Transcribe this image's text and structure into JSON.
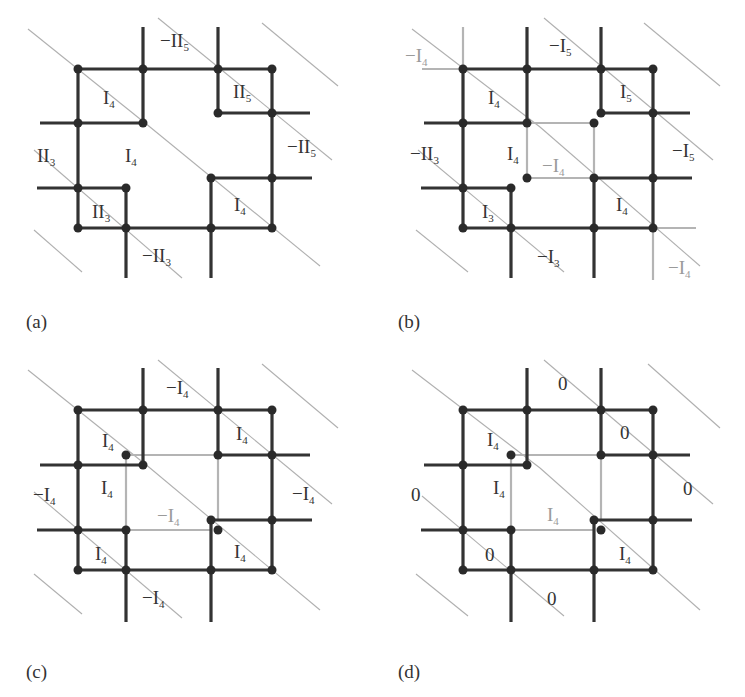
{
  "figure": {
    "panels": [
      {
        "id": "a",
        "caption": "(a)",
        "labels": [
          {
            "text": "−II",
            "sub": "5",
            "x": 160,
            "y": 47,
            "light": false
          },
          {
            "text": "I",
            "sub": "4",
            "x": 103,
            "y": 104,
            "light": false
          },
          {
            "text": "II",
            "sub": "5",
            "x": 233,
            "y": 98,
            "light": false
          },
          {
            "text": "II",
            "sub": "3",
            "x": 37,
            "y": 162,
            "light": false
          },
          {
            "text": "I",
            "sub": "4",
            "x": 125,
            "y": 162,
            "light": false
          },
          {
            "text": "−II",
            "sub": "5",
            "x": 287,
            "y": 153,
            "light": false
          },
          {
            "text": "II",
            "sub": "3",
            "x": 92,
            "y": 218,
            "light": false
          },
          {
            "text": "I",
            "sub": "4",
            "x": 234,
            "y": 211,
            "light": false
          },
          {
            "text": "−II",
            "sub": "3",
            "x": 142,
            "y": 262,
            "light": false
          }
        ]
      },
      {
        "id": "b",
        "caption": "(b)",
        "labels": [
          {
            "text": "−I",
            "sub": "4",
            "x": 405,
            "y": 62,
            "light": true
          },
          {
            "text": "−I",
            "sub": "5",
            "x": 549,
            "y": 52,
            "light": false
          },
          {
            "text": "I",
            "sub": "4",
            "x": 488,
            "y": 104,
            "light": false
          },
          {
            "text": "I",
            "sub": "5",
            "x": 620,
            "y": 98,
            "light": false
          },
          {
            "text": "−II",
            "sub": "3",
            "x": 410,
            "y": 160,
            "light": false
          },
          {
            "text": "I",
            "sub": "4",
            "x": 507,
            "y": 160,
            "light": false
          },
          {
            "text": "−I",
            "sub": "4",
            "x": 542,
            "y": 172,
            "light": true
          },
          {
            "text": "−I",
            "sub": "5",
            "x": 672,
            "y": 157,
            "light": false
          },
          {
            "text": "I",
            "sub": "3",
            "x": 482,
            "y": 218,
            "light": false
          },
          {
            "text": "I",
            "sub": "4",
            "x": 616,
            "y": 211,
            "light": false
          },
          {
            "text": "−I",
            "sub": "3",
            "x": 537,
            "y": 263,
            "light": false
          },
          {
            "text": "−I",
            "sub": "4",
            "x": 668,
            "y": 274,
            "light": true
          }
        ]
      },
      {
        "id": "c",
        "caption": "(c)",
        "labels": [
          {
            "text": "−I",
            "sub": "4",
            "x": 166,
            "y": 394,
            "light": false
          },
          {
            "text": "I",
            "sub": "4",
            "x": 102,
            "y": 447,
            "light": false
          },
          {
            "text": "I",
            "sub": "4",
            "x": 236,
            "y": 440,
            "light": false
          },
          {
            "text": "I",
            "sub": "4",
            "x": 101,
            "y": 494,
            "light": false
          },
          {
            "text": "−I",
            "sub": "4",
            "x": 33,
            "y": 501,
            "light": false
          },
          {
            "text": "−I",
            "sub": "4",
            "x": 292,
            "y": 500,
            "light": false
          },
          {
            "text": "−I",
            "sub": "4",
            "x": 157,
            "y": 522,
            "light": true
          },
          {
            "text": "I",
            "sub": "4",
            "x": 95,
            "y": 560,
            "light": false
          },
          {
            "text": "I",
            "sub": "4",
            "x": 234,
            "y": 558,
            "light": false
          },
          {
            "text": "−I",
            "sub": "4",
            "x": 142,
            "y": 604,
            "light": false
          }
        ]
      },
      {
        "id": "d",
        "caption": "(d)",
        "labels": [
          {
            "text": "0",
            "sub": "",
            "x": 558,
            "y": 390,
            "light": false
          },
          {
            "text": "I",
            "sub": "4",
            "x": 487,
            "y": 446,
            "light": false
          },
          {
            "text": "0",
            "sub": "",
            "x": 620,
            "y": 439,
            "light": false
          },
          {
            "text": "I",
            "sub": "4",
            "x": 493,
            "y": 494,
            "light": false
          },
          {
            "text": "0",
            "sub": "",
            "x": 411,
            "y": 501,
            "light": false
          },
          {
            "text": "0",
            "sub": "",
            "x": 683,
            "y": 495,
            "light": false
          },
          {
            "text": "I",
            "sub": "4",
            "x": 547,
            "y": 521,
            "light": true
          },
          {
            "text": "0",
            "sub": "",
            "x": 485,
            "y": 561,
            "light": false
          },
          {
            "text": "I",
            "sub": "4",
            "x": 619,
            "y": 560,
            "light": false
          },
          {
            "text": "0",
            "sub": "",
            "x": 547,
            "y": 605,
            "light": false
          }
        ]
      }
    ]
  }
}
